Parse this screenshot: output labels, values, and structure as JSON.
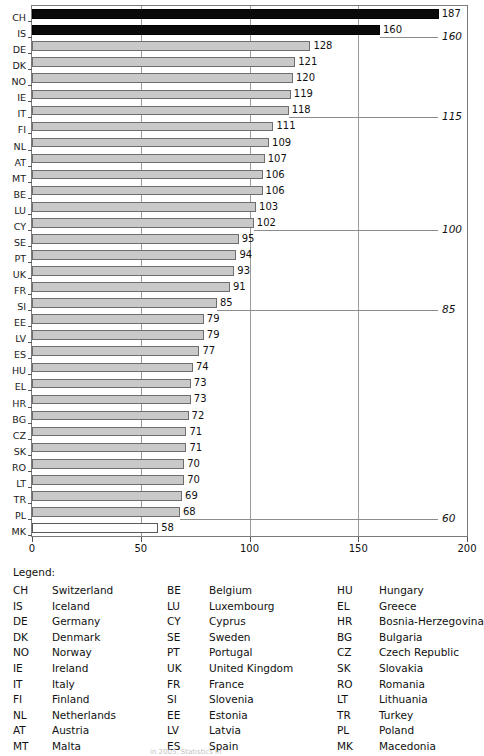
{
  "chart_data": {
    "type": "bar",
    "orientation": "horizontal",
    "title": "",
    "xlabel": "",
    "ylabel": "",
    "xlim": [
      0,
      200
    ],
    "xticks": [
      0,
      50,
      100,
      150,
      200
    ],
    "xtick_labels": [
      "0",
      "50",
      "100",
      "150",
      "200"
    ],
    "grid": true,
    "grid_axis": "x",
    "legend_position": "below-plot",
    "categories": [
      "CH",
      "IS",
      "DE",
      "DK",
      "NO",
      "IE",
      "IT",
      "FI",
      "NL",
      "AT",
      "MT",
      "BE",
      "LU",
      "CY",
      "SE",
      "PT",
      "UK",
      "FR",
      "SI",
      "EE",
      "LV",
      "ES",
      "HU",
      "EL",
      "HR",
      "BG",
      "CZ",
      "SK",
      "RO",
      "LT",
      "TR",
      "PL",
      "MK"
    ],
    "values": [
      187,
      160,
      128,
      121,
      120,
      119,
      118,
      111,
      109,
      107,
      106,
      106,
      103,
      102,
      95,
      94,
      93,
      91,
      85,
      79,
      79,
      77,
      74,
      73,
      73,
      72,
      71,
      71,
      70,
      70,
      69,
      68,
      58
    ],
    "bars": [
      {
        "code": "CH",
        "value": 187,
        "label": "187",
        "style": "dark"
      },
      {
        "code": "IS",
        "value": 160,
        "label": "160",
        "style": "dark"
      },
      {
        "code": "DE",
        "value": 128,
        "label": "128",
        "style": "grey"
      },
      {
        "code": "DK",
        "value": 121,
        "label": "121",
        "style": "grey"
      },
      {
        "code": "NO",
        "value": 120,
        "label": "120",
        "style": "grey"
      },
      {
        "code": "IE",
        "value": 119,
        "label": "119",
        "style": "grey"
      },
      {
        "code": "IT",
        "value": 118,
        "label": "118",
        "style": "grey"
      },
      {
        "code": "FI",
        "value": 111,
        "label": "111",
        "style": "grey"
      },
      {
        "code": "NL",
        "value": 109,
        "label": "109",
        "style": "grey"
      },
      {
        "code": "AT",
        "value": 107,
        "label": "107",
        "style": "grey"
      },
      {
        "code": "MT",
        "value": 106,
        "label": "106",
        "style": "grey"
      },
      {
        "code": "BE",
        "value": 106,
        "label": "106",
        "style": "grey"
      },
      {
        "code": "LU",
        "value": 103,
        "label": "103",
        "style": "grey"
      },
      {
        "code": "CY",
        "value": 102,
        "label": "102",
        "style": "grey"
      },
      {
        "code": "SE",
        "value": 95,
        "label": "95",
        "style": "grey"
      },
      {
        "code": "PT",
        "value": 94,
        "label": "94",
        "style": "grey"
      },
      {
        "code": "UK",
        "value": 93,
        "label": "93",
        "style": "grey"
      },
      {
        "code": "FR",
        "value": 91,
        "label": "91",
        "style": "grey"
      },
      {
        "code": "SI",
        "value": 85,
        "label": "85",
        "style": "grey"
      },
      {
        "code": "EE",
        "value": 79,
        "label": "79",
        "style": "grey"
      },
      {
        "code": "LV",
        "value": 79,
        "label": "79",
        "style": "grey"
      },
      {
        "code": "ES",
        "value": 77,
        "label": "77",
        "style": "grey"
      },
      {
        "code": "HU",
        "value": 74,
        "label": "74",
        "style": "grey"
      },
      {
        "code": "EL",
        "value": 73,
        "label": "73",
        "style": "grey"
      },
      {
        "code": "HR",
        "value": 73,
        "label": "73",
        "style": "grey"
      },
      {
        "code": "BG",
        "value": 72,
        "label": "72",
        "style": "grey"
      },
      {
        "code": "CZ",
        "value": 71,
        "label": "71",
        "style": "grey"
      },
      {
        "code": "SK",
        "value": 71,
        "label": "71",
        "style": "grey"
      },
      {
        "code": "RO",
        "value": 70,
        "label": "70",
        "style": "grey"
      },
      {
        "code": "LT",
        "value": 70,
        "label": "70",
        "style": "grey"
      },
      {
        "code": "TR",
        "value": 69,
        "label": "69",
        "style": "grey"
      },
      {
        "code": "PL",
        "value": 68,
        "label": "68",
        "style": "grey"
      },
      {
        "code": "MK",
        "value": 58,
        "label": "58",
        "style": "white"
      }
    ],
    "annotations": [
      {
        "label": "160",
        "value": 160,
        "after_category": "IS"
      },
      {
        "label": "115",
        "value": 115,
        "after_category": "IT"
      },
      {
        "label": "100",
        "value": 100,
        "after_category": "CY"
      },
      {
        "label": "85",
        "value": 85,
        "after_category": "SI"
      },
      {
        "label": "60",
        "value": 60,
        "after_category": "PL"
      }
    ],
    "colors": {
      "bar_grey_fill": "#c9c9c9",
      "bar_grey_edge": "#6e6e6e",
      "bar_dark_fill": "#0a0a0a",
      "bar_white_fill": "#ffffff",
      "gridline": "#9a9a9a",
      "frame": "#7b7b7b",
      "annotation_line": "#8c8c8c",
      "text": "#111111"
    }
  },
  "legend": {
    "title": "Legend:",
    "columns": [
      [
        {
          "code": "CH",
          "name": "Switzerland"
        },
        {
          "code": "IS",
          "name": "Iceland"
        },
        {
          "code": "DE",
          "name": "Germany"
        },
        {
          "code": "DK",
          "name": "Denmark"
        },
        {
          "code": "NO",
          "name": "Norway"
        },
        {
          "code": "IE",
          "name": "Ireland"
        },
        {
          "code": "IT",
          "name": "Italy"
        },
        {
          "code": "FI",
          "name": "Finland"
        },
        {
          "code": "NL",
          "name": "Netherlands"
        },
        {
          "code": "AT",
          "name": "Austria"
        },
        {
          "code": "MT",
          "name": "Malta"
        }
      ],
      [
        {
          "code": "BE",
          "name": "Belgium"
        },
        {
          "code": "LU",
          "name": "Luxembourg"
        },
        {
          "code": "CY",
          "name": "Cyprus"
        },
        {
          "code": "SE",
          "name": "Sweden"
        },
        {
          "code": "PT",
          "name": "Portugal"
        },
        {
          "code": "UK",
          "name": "United Kingdom"
        },
        {
          "code": "FR",
          "name": "France"
        },
        {
          "code": "SI",
          "name": "Slovenia"
        },
        {
          "code": "EE",
          "name": "Estonia"
        },
        {
          "code": "LV",
          "name": "Latvia"
        },
        {
          "code": "ES",
          "name": "Spain"
        }
      ],
      [
        {
          "code": "HU",
          "name": "Hungary"
        },
        {
          "code": "EL",
          "name": "Greece"
        },
        {
          "code": "HR",
          "name": "Bosnia-Herzegovina"
        },
        {
          "code": "BG",
          "name": "Bulgaria"
        },
        {
          "code": "CZ",
          "name": "Czech Republic"
        },
        {
          "code": "SK",
          "name": "Slovakia"
        },
        {
          "code": "RO",
          "name": "Romania"
        },
        {
          "code": "LT",
          "name": "Lithuania"
        },
        {
          "code": "TR",
          "name": "Turkey"
        },
        {
          "code": "PL",
          "name": "Poland"
        },
        {
          "code": "MK",
          "name": "Macedonia"
        }
      ]
    ]
  },
  "source_note": "in 2005, Statistics in"
}
